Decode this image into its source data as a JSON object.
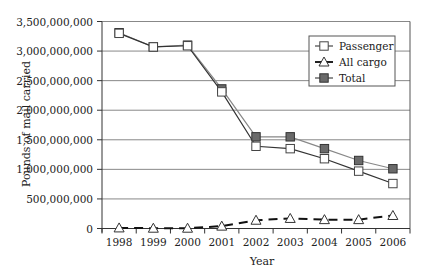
{
  "chart_data": {
    "type": "line",
    "title": "",
    "xlabel": "Year",
    "ylabel": "Pounds of mail carried",
    "ylim": [
      0,
      3500000000
    ],
    "yticks": [
      0,
      500000000,
      1000000000,
      1500000000,
      2000000000,
      2500000000,
      3000000000,
      3500000000
    ],
    "ytick_labels": [
      "0",
      "500,000,000",
      "1,000,000,000",
      "1,500,000,000",
      "2,000,000,000",
      "2,500,000,000",
      "3,000,000,000",
      "3,500,000,000"
    ],
    "categories": [
      "1998",
      "1999",
      "2000",
      "2001",
      "2002",
      "2003",
      "2004",
      "2005",
      "2006"
    ],
    "grid": "horizontal",
    "legend_position": "upper right (inside)",
    "series": [
      {
        "name": "Passenger",
        "marker": "square-open",
        "line": "solid",
        "color": "#444444",
        "values": [
          3300000000,
          3070000000,
          3090000000,
          2310000000,
          1390000000,
          1350000000,
          1180000000,
          970000000,
          760000000
        ]
      },
      {
        "name": "All cargo",
        "marker": "triangle-open",
        "line": "dashed",
        "color": "#111111",
        "values": [
          10000000,
          5000000,
          5000000,
          40000000,
          140000000,
          170000000,
          150000000,
          150000000,
          220000000
        ]
      },
      {
        "name": "Total",
        "marker": "square-filled",
        "line": "solid",
        "color": "#666666",
        "values": [
          3310000000,
          3070000000,
          3100000000,
          2360000000,
          1550000000,
          1550000000,
          1350000000,
          1150000000,
          1010000000
        ]
      }
    ]
  }
}
